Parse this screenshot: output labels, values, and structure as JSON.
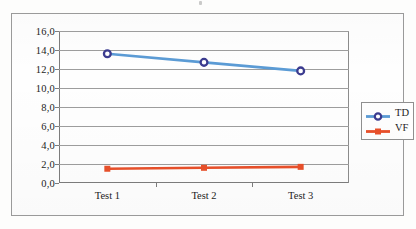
{
  "figure": {
    "background_color": "#fdfdfc",
    "frame_border_color": "#9a9a9a"
  },
  "legend": {
    "position": "right",
    "items": [
      {
        "label": "TD",
        "line_color": "#5B9BD5",
        "marker_color": "#3B3B8F",
        "marker": "circle-open"
      },
      {
        "label": "VF",
        "line_color": "#E8502A",
        "marker_color": "#E8502A",
        "marker": "square"
      }
    ]
  },
  "chart_data": {
    "type": "line",
    "title": "",
    "xlabel": "",
    "ylabel": "",
    "categories": [
      "Test 1",
      "Test 2",
      "Test 3"
    ],
    "ylim": [
      0,
      16
    ],
    "ytick_step": 2,
    "ytick_labels": [
      "0,0",
      "2,0",
      "4,0",
      "6,0",
      "8,0",
      "10,0",
      "12,0",
      "14,0",
      "16,0"
    ],
    "ytick_values": [
      0,
      2,
      4,
      6,
      8,
      10,
      12,
      14,
      16
    ],
    "grid": true,
    "grid_axis": "y",
    "legend_position": "right",
    "series": [
      {
        "name": "TD",
        "values": [
          13.6,
          12.7,
          11.8
        ],
        "color": "#5B9BD5",
        "marker_color": "#3B3B8F",
        "marker": "circle-open"
      },
      {
        "name": "VF",
        "values": [
          1.5,
          1.6,
          1.7
        ],
        "color": "#E8502A",
        "marker_color": "#E8502A",
        "marker": "square"
      }
    ]
  }
}
